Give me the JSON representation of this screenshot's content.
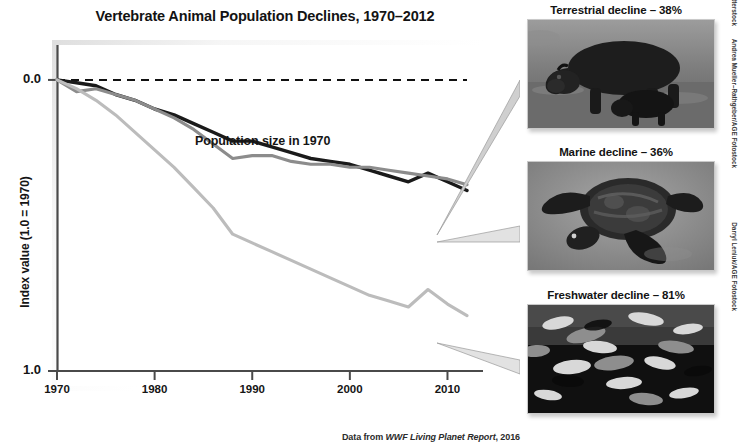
{
  "title": "Vertebrate Animal Population Declines, 1970–2012",
  "source_note": {
    "prefix": "Data from ",
    "italic": "WWF Living Planet Report",
    "suffix": ", 2016"
  },
  "axes": {
    "y_title": "Index value (1.0 = 1970)",
    "y_ticks": [
      "1.0",
      "0.0"
    ],
    "x_ticks": [
      "1970",
      "1980",
      "1990",
      "2000",
      "2010"
    ]
  },
  "annotations": {
    "baseline_label": "Population size in 1970"
  },
  "panels": [
    {
      "caption": "Terrestrial decline – 38%",
      "credit": "Stephen Raato/Shutterstock",
      "image_name": "hippo-photo"
    },
    {
      "caption": "Marine decline – 36%",
      "credit": "Andrea Mueller–Rathgeber/AGE Fotostock",
      "image_name": "sea-turtle-photo"
    },
    {
      "caption": "Freshwater decline – 81%",
      "credit": "Darryl Leniuk/AGE Fotostock",
      "image_name": "fish-school-photo"
    }
  ],
  "colors": {
    "terrestrial": "#1a1a1a",
    "marine": "#8c8c8c",
    "freshwater": "#bcbcbc",
    "baseline": "#111111",
    "axis": "#4a4a4a"
  },
  "chart_data": {
    "type": "line",
    "title": "Vertebrate Animal Population Declines, 1970–2012",
    "xlabel": "",
    "ylabel": "Index value (1.0 = 1970)",
    "xlim": [
      1970,
      2012
    ],
    "ylim": [
      0.0,
      1.12
    ],
    "yticks": [
      0.0,
      1.0
    ],
    "xticks": [
      1970,
      1980,
      1990,
      2000,
      2010
    ],
    "grid": false,
    "legend": "none (series labeled by photo callouts)",
    "reference_line": {
      "y": 1.0,
      "style": "dashed",
      "label": "Population size in 1970"
    },
    "x": [
      1970,
      1972,
      1974,
      1976,
      1978,
      1980,
      1982,
      1984,
      1986,
      1988,
      1990,
      1992,
      1994,
      1996,
      1998,
      2000,
      2002,
      2004,
      2006,
      2008,
      2010,
      2012
    ],
    "series": [
      {
        "name": "Terrestrial",
        "color": "#1a1a1a",
        "final_decline_pct": 38,
        "values": [
          1.0,
          0.99,
          0.98,
          0.95,
          0.93,
          0.9,
          0.88,
          0.85,
          0.82,
          0.79,
          0.79,
          0.77,
          0.75,
          0.73,
          0.72,
          0.71,
          0.69,
          0.67,
          0.65,
          0.68,
          0.65,
          0.62
        ]
      },
      {
        "name": "Marine",
        "color": "#8c8c8c",
        "final_decline_pct": 36,
        "values": [
          1.0,
          0.96,
          0.97,
          0.95,
          0.93,
          0.9,
          0.87,
          0.83,
          0.78,
          0.73,
          0.74,
          0.74,
          0.72,
          0.71,
          0.71,
          0.7,
          0.7,
          0.69,
          0.68,
          0.67,
          0.66,
          0.64
        ]
      },
      {
        "name": "Freshwater",
        "color": "#bcbcbc",
        "final_decline_pct": 81,
        "values": [
          1.0,
          0.97,
          0.93,
          0.88,
          0.82,
          0.76,
          0.7,
          0.63,
          0.56,
          0.47,
          0.44,
          0.41,
          0.38,
          0.35,
          0.32,
          0.29,
          0.26,
          0.24,
          0.22,
          0.28,
          0.23,
          0.19
        ]
      }
    ]
  }
}
